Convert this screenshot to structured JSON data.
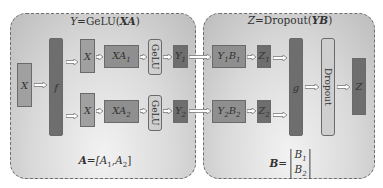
{
  "left_panel": {
    "title_lhs": "Y",
    "title_eq": "=GeLU(",
    "title_arg": "XA",
    "title_close": ")",
    "input_label": "X",
    "split_label": "f",
    "branch1": {
      "x_label": "X",
      "product_label": "XA",
      "product_sub": "1",
      "activation_label": "GeLU",
      "output_label": "Y",
      "output_sub": "1"
    },
    "branch2": {
      "x_label": "X",
      "product_label": "XA",
      "product_sub": "2",
      "activation_label": "GeLU",
      "output_label": "Y",
      "output_sub": "2"
    },
    "formula_lhs": "A",
    "formula_rhs_open": "=[A",
    "formula_sub1": "1",
    "formula_mid": ",A",
    "formula_sub2": "2",
    "formula_close": "]"
  },
  "right_panel": {
    "title_lhs": "Z",
    "title_eq": "=Dropout(",
    "title_arg": "YB",
    "title_close": ")",
    "branch1": {
      "product_y": "Y",
      "product_y_sub": "1",
      "product_b": "B",
      "product_b_sub": "1",
      "z_label": "Z",
      "z_sub": "1"
    },
    "branch2": {
      "product_y": "Y",
      "product_y_sub": "2",
      "product_b": "B",
      "product_b_sub": "2",
      "z_label": "Z",
      "z_sub": "2"
    },
    "reduce_label": "g",
    "dropout_label": "Dropout",
    "output_label": "Z",
    "formula_lhs": "B",
    "formula_eq": "=",
    "matrix_row1": "B",
    "matrix_row1_sub": "1",
    "matrix_row2": "B",
    "matrix_row2_sub": "2"
  }
}
